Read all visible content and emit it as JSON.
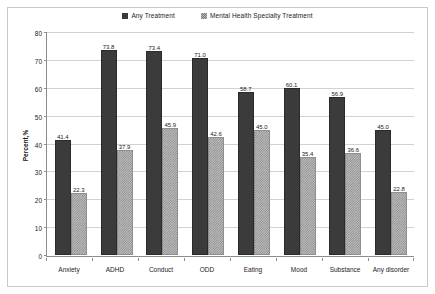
{
  "chart_data": {
    "type": "bar",
    "title": "",
    "subtitle": "",
    "xlabel": "",
    "ylabel": "Percent,%",
    "ylim": [
      0,
      80
    ],
    "yticks": [
      0,
      10,
      20,
      30,
      40,
      50,
      60,
      70,
      80
    ],
    "ytick_labels": [
      "0",
      "10",
      "20",
      "30",
      "40",
      "50",
      "60",
      "70",
      "80"
    ],
    "grid": true,
    "legend_position": "top-center",
    "categories": [
      "Anxiety",
      "ADHD",
      "Conduct",
      "ODD",
      "Eating",
      "Mood",
      "Substance",
      "Any disorder"
    ],
    "series": [
      {
        "name": "Any Treatment",
        "color": "#3b3b3b",
        "pattern": "solid",
        "values": [
          41.4,
          73.8,
          73.4,
          71.0,
          58.7,
          60.1,
          56.9,
          45.0
        ],
        "labels": [
          "41.4",
          "73.8",
          "73.4",
          "71.0",
          "58.7",
          "60.1",
          "56.9",
          "45.0"
        ]
      },
      {
        "name": "Mental Health Specialty Treatment",
        "color": "#bdbdbd",
        "pattern": "checkered",
        "values": [
          22.3,
          37.9,
          45.9,
          42.6,
          45.0,
          35.4,
          36.6,
          22.8
        ],
        "labels": [
          "22.3",
          "37.9",
          "45.9",
          "42.6",
          "45.0",
          "35.4",
          "36.6",
          "22.8"
        ]
      }
    ]
  }
}
